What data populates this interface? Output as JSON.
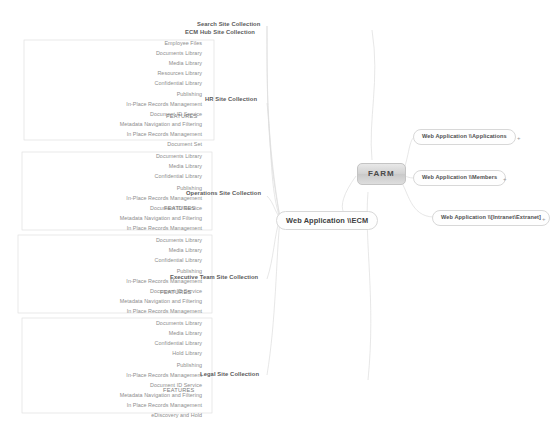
{
  "diagram": {
    "title": "FARM",
    "root": {
      "label": "FARM"
    },
    "features_label": "FEATURES",
    "expander_symbol": "+"
  },
  "web_applications": [
    {
      "id": "applications",
      "label": "Web Application \\\\Applications",
      "expander": "+"
    },
    {
      "id": "members",
      "label": "Web Application \\\\Members",
      "expander": "+"
    },
    {
      "id": "intranet_extranet",
      "label": "Web Application \\\\[Intranet\\Extranet]",
      "expander": "+"
    },
    {
      "id": "ecm",
      "label": "Web Application \\\\ECM",
      "expander": ""
    }
  ],
  "top_collections": [
    {
      "label": "Search Site Collection"
    },
    {
      "label": "ECM Hub Site Collection"
    }
  ],
  "site_collections": [
    {
      "id": "hr",
      "label": "HR Site Collection",
      "features_label": "FEATURES",
      "libraries": [
        "Employee Files",
        "Documents Library",
        "Media Library",
        "Resources Library",
        "Confidential Library"
      ],
      "features": [
        "Publishing",
        "In-Place Records Management",
        "Document ID Service",
        "Metadata Navigation and Filtering",
        "In Place Records Management",
        "Document Set"
      ]
    },
    {
      "id": "operations",
      "label": "Operations Site Collection",
      "features_label": "FEATURES",
      "libraries": [
        "Documents Library",
        "Media Library",
        "Confidential Library"
      ],
      "features": [
        "Publishing",
        "In-Place Records Management",
        "Document ID Service",
        "Metadata Navigation and Filtering",
        "In Place Records Management"
      ]
    },
    {
      "id": "executive",
      "label": "Executive Team Site Collection",
      "features_label": "FEATURES",
      "libraries": [
        "Documents Library",
        "Media Library",
        "Confidential Library"
      ],
      "features": [
        "Publishing",
        "In-Place Records Management",
        "Document ID Service",
        "Metadata Navigation and Filtering",
        "In Place Records Management"
      ]
    },
    {
      "id": "legal",
      "label": "Legal Site Collection",
      "features_label": "FEATURES",
      "libraries": [
        "Documents Library",
        "Media Library",
        "Confidential Library",
        "Hold Library"
      ],
      "features": [
        "Publishing",
        "In-Place Records Management",
        "Document ID Service",
        "Metadata Navigation and Filtering",
        "In Place Records Management",
        "eDiscovery and Hold"
      ]
    }
  ],
  "colors": {
    "leaf_text": "#8d8d8d",
    "collection_text": "#5a5a5a",
    "node_border": "#d8d8d8",
    "link": "#dcdcdc",
    "root_fill": "#d2d2d2"
  }
}
